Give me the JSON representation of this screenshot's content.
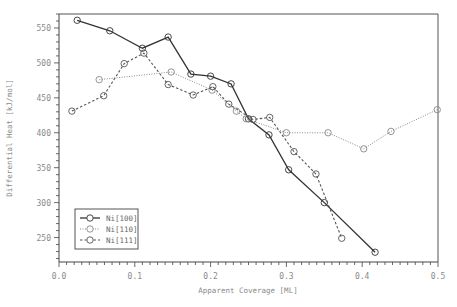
{
  "chart_data": {
    "type": "line",
    "title": "",
    "xlabel": "Apparent Coverage [ML]",
    "ylabel": "Differential Heat [kJ/mol]",
    "xlim": [
      0.0,
      0.5
    ],
    "ylim": [
      215,
      570
    ],
    "x_ticks": [
      0.0,
      0.1,
      0.2,
      0.3,
      0.4,
      0.5
    ],
    "x_tick_labels": [
      "0.0",
      "0.1",
      "0.2",
      "0.3",
      "0.4",
      "0.5"
    ],
    "y_ticks": [
      250,
      300,
      350,
      400,
      450,
      500,
      550
    ],
    "y_tick_labels": [
      "250",
      "300",
      "350",
      "400",
      "450",
      "500",
      "550"
    ],
    "grid": false,
    "legend_position": "lower left",
    "series": [
      {
        "name": "Ni[100]",
        "color": "#333333",
        "dash": "solid",
        "marker": "open-circle",
        "x": [
          0.024,
          0.067,
          0.11,
          0.144,
          0.174,
          0.2,
          0.227,
          0.25,
          0.277,
          0.303,
          0.35,
          0.417
        ],
        "y": [
          561,
          546,
          521,
          537,
          484,
          481,
          470,
          420,
          397,
          347,
          300,
          229
        ]
      },
      {
        "name": "Ni[110]",
        "color": "#888888",
        "dash": "dotted",
        "marker": "open-circle",
        "x": [
          0.053,
          0.148,
          0.202,
          0.234,
          0.247,
          0.3,
          0.355,
          0.402,
          0.438,
          0.499
        ],
        "y": [
          476,
          487,
          461,
          431,
          420,
          400,
          400,
          377,
          402,
          433
        ]
      },
      {
        "name": "Ni[111]",
        "color": "#555555",
        "dash": "dashed",
        "marker": "open-circle",
        "x": [
          0.017,
          0.059,
          0.086,
          0.112,
          0.144,
          0.177,
          0.203,
          0.224,
          0.256,
          0.278,
          0.31,
          0.339,
          0.373
        ],
        "y": [
          431,
          453,
          499,
          514,
          469,
          454,
          466,
          441,
          419,
          422,
          373,
          341,
          249
        ]
      }
    ]
  }
}
